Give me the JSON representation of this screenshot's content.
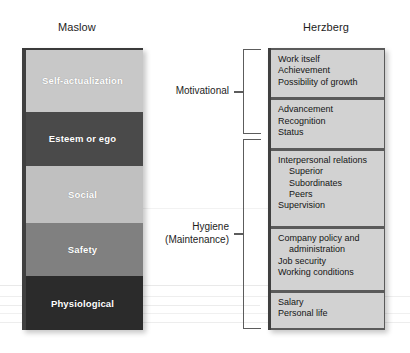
{
  "figure": {
    "columns": {
      "maslow": {
        "title": "Maslow",
        "bands": [
          {
            "label": "Self-actualization",
            "color": "#c8c8c8",
            "text_color": "#ffffff",
            "height_px": 62
          },
          {
            "label": "Esteem or ego",
            "color": "#4a4a4a",
            "text_color": "#ffffff",
            "height_px": 55
          },
          {
            "label": "Social",
            "color": "#c0c0c0",
            "text_color": "#ffffff",
            "height_px": 57
          },
          {
            "label": "Safety",
            "color": "#808080",
            "text_color": "#ffffff",
            "height_px": 54
          },
          {
            "label": "Physiological",
            "color": "#2b2b2b",
            "text_color": "#ffffff",
            "height_px": 54
          }
        ]
      },
      "herzberg": {
        "title": "Herzberg",
        "boxes": [
          {
            "group": "Motivational",
            "lines": [
              {
                "text": "Work itself",
                "indent": false
              },
              {
                "text": "Achievement",
                "indent": false
              },
              {
                "text": "Possibility of growth",
                "indent": false
              }
            ]
          },
          {
            "group": "Motivational",
            "lines": [
              {
                "text": "Advancement",
                "indent": false
              },
              {
                "text": "Recognition",
                "indent": false
              },
              {
                "text": "Status",
                "indent": false
              }
            ]
          },
          {
            "group": "Hygiene",
            "lines": [
              {
                "text": "Interpersonal relations",
                "indent": false
              },
              {
                "text": "Superior",
                "indent": true
              },
              {
                "text": "Subordinates",
                "indent": true
              },
              {
                "text": "Peers",
                "indent": true
              },
              {
                "text": "Supervision",
                "indent": false
              }
            ]
          },
          {
            "group": "Hygiene",
            "lines": [
              {
                "text": "Company policy and",
                "indent": false
              },
              {
                "text": "administration",
                "indent": true
              },
              {
                "text": "Job security",
                "indent": false
              },
              {
                "text": "Working conditions",
                "indent": false
              }
            ]
          },
          {
            "group": "Hygiene",
            "lines": [
              {
                "text": "Salary",
                "indent": false
              },
              {
                "text": "Personal life",
                "indent": false
              }
            ]
          }
        ],
        "box_fill_color": "#d2d2d2",
        "box_border_color": "#5a5a5a"
      }
    },
    "brackets": [
      {
        "key": "motivational",
        "label_line_1": "Motivational",
        "label_line_2": "",
        "spans_boxes": [
          1,
          2
        ]
      },
      {
        "key": "hygiene",
        "label_line_1": "Hygiene",
        "label_line_2": "(Maintenance)",
        "spans_boxes": [
          3,
          4,
          5
        ]
      }
    ]
  }
}
